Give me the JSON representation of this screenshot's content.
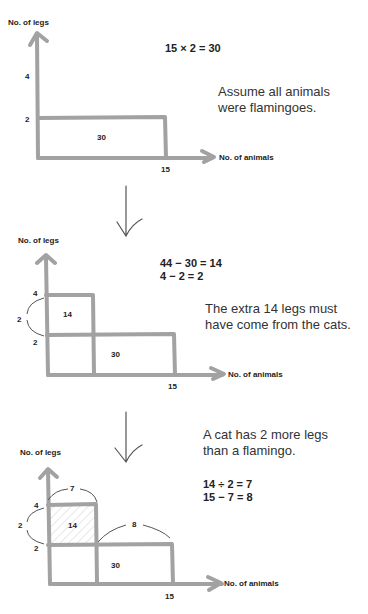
{
  "stroke_color": "#a2a2a2",
  "panels": [
    {
      "y_axis_label": "No. of legs",
      "x_axis_label": "No. of animals",
      "y_ticks": [
        "4",
        "2"
      ],
      "x_tick": "15",
      "areas": [
        "30"
      ],
      "equations": [
        "15 × 2 = 30"
      ],
      "note": [
        "Assume all animals",
        "were flamingoes."
      ]
    },
    {
      "y_axis_label": "No. of legs",
      "x_axis_label": "No. of animals",
      "y_ticks": [
        "4",
        "2"
      ],
      "x_tick": "15",
      "brace_left": "2",
      "areas": [
        "14",
        "30"
      ],
      "equations": [
        "44 − 30 = 14",
        "4 − 2 = 2"
      ],
      "note": [
        "The extra 14 legs must",
        "have come from the cats."
      ]
    },
    {
      "y_axis_label": "No. of legs",
      "x_axis_label": "No. of animals",
      "y_ticks": [
        "4",
        "2"
      ],
      "x_tick": "15",
      "brace_left": "2",
      "brace_top_cats": "7",
      "brace_top_flamingoes": "8",
      "areas": [
        "14",
        "30"
      ],
      "equations": [
        "14 ÷ 2 = 7",
        "15 − 7 = 8"
      ],
      "note": [
        "A cat has 2 more legs",
        "than a flamingo."
      ]
    }
  ],
  "arrows": [
    "down-arrow",
    "down-arrow"
  ]
}
